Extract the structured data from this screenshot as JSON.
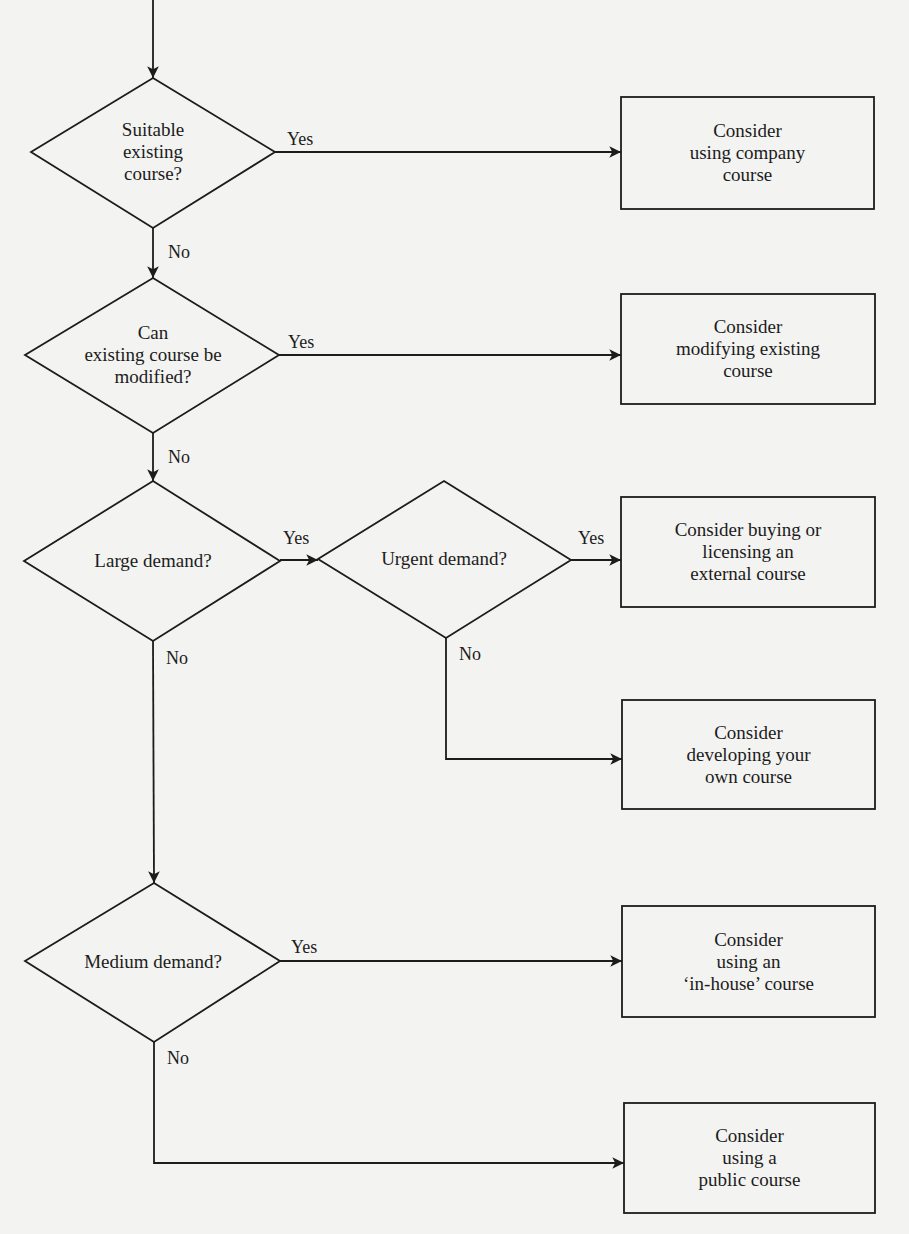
{
  "diagram": {
    "type": "flowchart",
    "colors": {
      "background": "#f3f3f1",
      "stroke": "#1c1c1c",
      "text": "#1c1c1c"
    },
    "decisions": [
      {
        "id": "d1",
        "text": "Suitable\nexisting\ncourse?"
      },
      {
        "id": "d2",
        "text": "Can\nexisting course be\nmodified?"
      },
      {
        "id": "d3",
        "text": "Large demand?"
      },
      {
        "id": "d4",
        "text": "Urgent demand?"
      },
      {
        "id": "d5",
        "text": "Medium demand?"
      }
    ],
    "outcomes": [
      {
        "id": "o1",
        "text": "Consider\nusing company\ncourse"
      },
      {
        "id": "o2",
        "text": "Consider\nmodifying existing\ncourse"
      },
      {
        "id": "o3",
        "text": "Consider buying or\nlicensing an\nexternal course"
      },
      {
        "id": "o4",
        "text": "Consider\ndeveloping your\nown course"
      },
      {
        "id": "o5",
        "text": "Consider\nusing an\n‘in-house’ course"
      },
      {
        "id": "o6",
        "text": "Consider\nusing a\npublic course"
      }
    ],
    "edges": [
      {
        "from": "start",
        "to": "d1",
        "label": ""
      },
      {
        "from": "d1",
        "to": "o1",
        "label": "Yes"
      },
      {
        "from": "d1",
        "to": "d2",
        "label": "No"
      },
      {
        "from": "d2",
        "to": "o2",
        "label": "Yes"
      },
      {
        "from": "d2",
        "to": "d3",
        "label": "No"
      },
      {
        "from": "d3",
        "to": "d4",
        "label": "Yes"
      },
      {
        "from": "d4",
        "to": "o3",
        "label": "Yes"
      },
      {
        "from": "d4",
        "to": "o4",
        "label": "No"
      },
      {
        "from": "d3",
        "to": "d5",
        "label": "No"
      },
      {
        "from": "d5",
        "to": "o5",
        "label": "Yes"
      },
      {
        "from": "d5",
        "to": "o6",
        "label": "No"
      }
    ]
  }
}
